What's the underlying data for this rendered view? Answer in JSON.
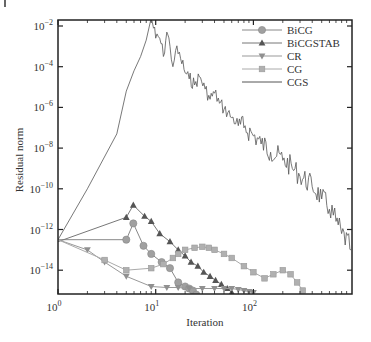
{
  "chart_data": {
    "type": "line",
    "title": "",
    "xlabel": "Iteration",
    "ylabel": "Residual norm",
    "xscale": "log",
    "yscale": "log",
    "xlim": [
      1,
      1000
    ],
    "ylim_exponent": [
      -15.2,
      -1.7
    ],
    "x_ticks": [
      {
        "exp": 0,
        "label": "10",
        "sup": "0"
      },
      {
        "exp": 1,
        "label": "10",
        "sup": "1"
      },
      {
        "exp": 2,
        "label": "10",
        "sup": "2"
      }
    ],
    "y_ticks": [
      {
        "exp": -2,
        "label": "10",
        "sup": "-2"
      },
      {
        "exp": -4,
        "label": "10",
        "sup": "-4"
      },
      {
        "exp": -6,
        "label": "10",
        "sup": "-6"
      },
      {
        "exp": -8,
        "label": "10",
        "sup": "-8"
      },
      {
        "exp": -10,
        "label": "10",
        "sup": "-10"
      },
      {
        "exp": -12,
        "label": "10",
        "sup": "-12"
      },
      {
        "exp": -14,
        "label": "10",
        "sup": "-14"
      }
    ],
    "grid": false,
    "legend_position": "upper right",
    "series": [
      {
        "name": "BiCG",
        "marker": "circle",
        "color": "#a0a0a0",
        "line_color": "#888888",
        "x": [
          1,
          5,
          5.9,
          7.5,
          9,
          11.5,
          14,
          17,
          20,
          22,
          24,
          26
        ],
        "log10_y": [
          -12.5,
          -12.5,
          -11.7,
          -12.8,
          -13.2,
          -13.6,
          -13.9,
          -14.6,
          -14.8,
          -14.9,
          -15.0,
          -15.2
        ]
      },
      {
        "name": "BiCGSTAB",
        "marker": "triangle-up",
        "color": "#555555",
        "line_color": "#777777",
        "x": [
          1,
          5,
          5.9,
          7.7,
          9,
          11,
          14,
          17,
          20,
          23,
          27,
          31,
          36,
          41,
          47,
          54,
          60
        ],
        "log10_y": [
          -12.6,
          -11.4,
          -10.8,
          -11.35,
          -11.6,
          -12.2,
          -12.6,
          -13.0,
          -13.3,
          -13.6,
          -13.8,
          -14.1,
          -14.3,
          -14.5,
          -14.7,
          -14.9,
          -15.1
        ]
      },
      {
        "name": "CR",
        "marker": "triangle-down",
        "color": "#909090",
        "line_color": "#999999",
        "x": [
          1,
          2,
          3,
          5,
          9,
          13,
          17,
          22,
          30,
          40,
          50,
          60,
          70,
          80,
          90,
          100
        ],
        "log10_y": [
          -12.5,
          -13.0,
          -13.6,
          -14.3,
          -14.8,
          -14.85,
          -14.85,
          -14.9,
          -14.9,
          -14.9,
          -14.9,
          -14.9,
          -14.95,
          -15.0,
          -15.05,
          -15.1
        ]
      },
      {
        "name": "CG",
        "marker": "square",
        "color": "#b0b0b0",
        "line_color": "#aaaaaa",
        "x": [
          1,
          3,
          5,
          9,
          12,
          15,
          17,
          20,
          25,
          30,
          35,
          40,
          50,
          60,
          80,
          100,
          130,
          160,
          200,
          240,
          280,
          320
        ],
        "log10_y": [
          -12.5,
          -13.5,
          -14.0,
          -13.9,
          -13.7,
          -13.4,
          -13.2,
          -13.0,
          -12.9,
          -12.85,
          -12.9,
          -13.0,
          -13.2,
          -13.4,
          -13.8,
          -14.1,
          -14.4,
          -14.2,
          -14.0,
          -14.2,
          -14.6,
          -15.0
        ]
      },
      {
        "name": "CGS",
        "marker": "none",
        "color": "#444444",
        "line_color": "#555555",
        "x": [
          1,
          2,
          4,
          5,
          6,
          7,
          8,
          9,
          10,
          11,
          12,
          13,
          14,
          15,
          16,
          18,
          20,
          22,
          25,
          28,
          32,
          36,
          40,
          45,
          50,
          60,
          70,
          80,
          100,
          120,
          150,
          200,
          250,
          300,
          400,
          500,
          600,
          700,
          800,
          1000
        ],
        "log10_y": [
          -12.5,
          -10.0,
          -7.3,
          -5.2,
          -4.2,
          -3.5,
          -2.7,
          -1.6,
          -2.6,
          -2.6,
          -3.5,
          -2.3,
          -3.0,
          -4.0,
          -3.2,
          -3.6,
          -4.3,
          -4.6,
          -4.9,
          -4.5,
          -5.1,
          -5.6,
          -5.3,
          -5.8,
          -6.1,
          -6.5,
          -6.9,
          -7.0,
          -7.4,
          -7.8,
          -8.2,
          -8.6,
          -9.0,
          -9.4,
          -9.9,
          -10.5,
          -11.0,
          -11.6,
          -12.2,
          -13.0
        ]
      }
    ]
  },
  "legend": {
    "items": [
      {
        "label": "BiCG"
      },
      {
        "label": "BiCGSTAB"
      },
      {
        "label": "CR"
      },
      {
        "label": "CG"
      },
      {
        "label": "CGS"
      }
    ]
  }
}
